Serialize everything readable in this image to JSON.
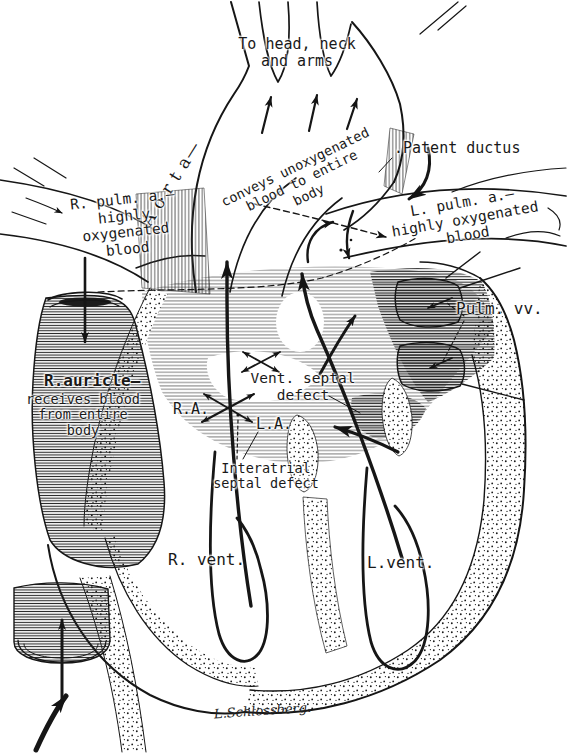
{
  "labels": {
    "to_head": "To head, neck\nand arms",
    "aorta": "A o r t a—",
    "aorta_desc": "conveys unoxygenated\nblood to entire\nbody",
    "patent_ductus": ".Patent ductus",
    "l_pulm": "L. pulm. a.—\nhighly oxygenated\nblood",
    "r_pulm": "R. pulm. a.—\nhighly\noxygenated\nblood",
    "pulm_vv": "Pulm. vv.",
    "r_auricle": "R.auricle—",
    "r_auricle_desc": "receives blood\nfrom entire\nbody",
    "ra": "R.A.",
    "la": "L.A.",
    "vent_septal": "Vent. septal\ndefect",
    "interatrial": "Interatrial\nseptal defect",
    "r_vent": "R. vent.",
    "l_vent": "L.vent.",
    "signature": "L.Schlossberg."
  },
  "style": {
    "ink_color": "#161616",
    "paper_color": "#ffffff"
  }
}
